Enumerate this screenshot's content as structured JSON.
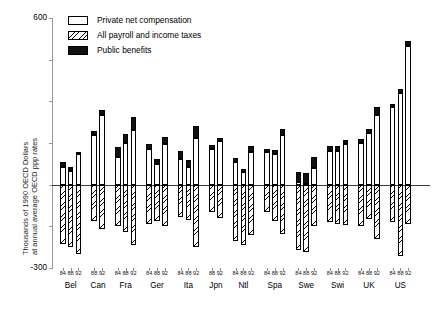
{
  "chart_data": {
    "type": "bar",
    "title": "",
    "subtitle": "",
    "xlabel": "",
    "ylabel": "Thousands of 1990 OECD Dollars at annual average OECD ppp rates",
    "ylabel_line1": "Thousands of 1990 OECD Dollars",
    "ylabel_line2": "at annual average OECD ppp rates",
    "ylim": [
      -300,
      600
    ],
    "ytick_values": [
      600,
      -300
    ],
    "ytick_labels": [
      "600",
      "-300"
    ],
    "yticks_unlabeled": [
      450,
      300,
      150,
      0,
      -150
    ],
    "grid": false,
    "legend_position": "top-left",
    "stacked": true,
    "zero_line": 0,
    "legend": [
      {
        "key": "compensation",
        "label": "Private net compensation",
        "fill": "white"
      },
      {
        "key": "taxes",
        "label": "All payroll and income taxes",
        "fill": "hatched"
      },
      {
        "key": "benefits",
        "label": "Public benefits",
        "fill": "black"
      }
    ],
    "series": [
      {
        "name": "Private net compensation",
        "key": "compensation"
      },
      {
        "name": "All payroll and income taxes",
        "key": "taxes"
      },
      {
        "name": "Public benefits",
        "key": "benefits"
      }
    ],
    "groups": [
      {
        "country": "Bel",
        "bars": [
          {
            "year": "84",
            "compensation": 62,
            "benefits": 18,
            "taxes": -212
          },
          {
            "year": "88",
            "compensation": 48,
            "benefits": 16,
            "taxes": -225
          },
          {
            "year": "92",
            "compensation": 110,
            "benefits": 8,
            "taxes": -248
          }
        ]
      },
      {
        "country": "Can",
        "bars": [
          {
            "year": "88",
            "compensation": 178,
            "benefits": 16,
            "taxes": -130
          },
          {
            "year": "92",
            "compensation": 250,
            "benefits": 20,
            "taxes": -158
          }
        ]
      },
      {
        "country": "Fra",
        "bars": [
          {
            "year": "84",
            "compensation": 100,
            "benefits": 36,
            "taxes": -150
          },
          {
            "year": "88",
            "compensation": 150,
            "benefits": 32,
            "taxes": -170
          },
          {
            "year": "92",
            "compensation": 198,
            "benefits": 44,
            "taxes": -218
          }
        ]
      },
      {
        "country": "Ger",
        "bars": [
          {
            "year": "84",
            "compensation": 128,
            "benefits": 18,
            "taxes": -140
          },
          {
            "year": "88",
            "compensation": 76,
            "benefits": 18,
            "taxes": -132
          },
          {
            "year": "92",
            "compensation": 148,
            "benefits": 22,
            "taxes": -150
          }
        ]
      },
      {
        "country": "Ita",
        "bars": [
          {
            "year": "84",
            "compensation": 94,
            "benefits": 28,
            "taxes": -118
          },
          {
            "year": "88",
            "compensation": 64,
            "benefits": 26,
            "taxes": -128
          },
          {
            "year": "92",
            "compensation": 168,
            "benefits": 44,
            "taxes": -226
          }
        ]
      },
      {
        "country": "Jpn",
        "bars": [
          {
            "year": "88",
            "compensation": 130,
            "benefits": 14,
            "taxes": -100
          },
          {
            "year": "92",
            "compensation": 158,
            "benefits": 10,
            "taxes": -120
          }
        ]
      },
      {
        "country": "Ntl",
        "bars": [
          {
            "year": "84",
            "compensation": 82,
            "benefits": 14,
            "taxes": -204
          },
          {
            "year": "88",
            "compensation": 44,
            "benefits": 14,
            "taxes": -218
          },
          {
            "year": "92",
            "compensation": 118,
            "benefits": 22,
            "taxes": -180
          }
        ]
      },
      {
        "country": "Spa",
        "bars": [
          {
            "year": "84",
            "compensation": 116,
            "benefits": 12,
            "taxes": -100
          },
          {
            "year": "88",
            "compensation": 112,
            "benefits": 12,
            "taxes": -130
          },
          {
            "year": "92",
            "compensation": 178,
            "benefits": 24,
            "taxes": -176
          }
        ]
      },
      {
        "country": "Swe",
        "bars": [
          {
            "year": "84",
            "compensation": 10,
            "benefits": 36,
            "taxes": -236
          },
          {
            "year": "88",
            "compensation": 4,
            "benefits": 38,
            "taxes": -244
          },
          {
            "year": "92",
            "compensation": 60,
            "benefits": 38,
            "taxes": -148
          }
        ]
      },
      {
        "country": "Swi",
        "bars": [
          {
            "year": "84",
            "compensation": 122,
            "benefits": 18,
            "taxes": -136
          },
          {
            "year": "88",
            "compensation": 120,
            "benefits": 18,
            "taxes": -140
          },
          {
            "year": "92",
            "compensation": 146,
            "benefits": 14,
            "taxes": -146
          }
        ]
      },
      {
        "country": "UK",
        "bars": [
          {
            "year": "84",
            "compensation": 150,
            "benefits": 14,
            "taxes": -150
          },
          {
            "year": "88",
            "compensation": 186,
            "benefits": 16,
            "taxes": -124
          },
          {
            "year": "92",
            "compensation": 252,
            "benefits": 26,
            "taxes": -196
          }
        ]
      },
      {
        "country": "US",
        "bars": [
          {
            "year": "84",
            "compensation": 280,
            "benefits": 12,
            "taxes": -136
          },
          {
            "year": "88",
            "compensation": 330,
            "benefits": 14,
            "taxes": -258
          },
          {
            "year": "92",
            "compensation": 500,
            "benefits": 16,
            "taxes": -140
          }
        ]
      }
    ]
  }
}
